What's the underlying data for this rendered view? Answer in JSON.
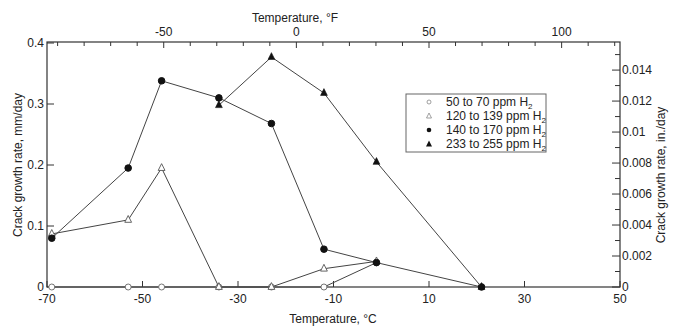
{
  "chart_data": {
    "type": "line",
    "title": "",
    "xlabel": "Temperature, °C",
    "ylabel": "Crack growth rate, mm/day",
    "x2label": "Temperature, °F",
    "y2label": "Crack growth rate, in./day",
    "xlim": [
      -70,
      50
    ],
    "ylim": [
      0,
      0.4
    ],
    "x2lim_F": [
      -94,
      122
    ],
    "y2lim_in": [
      0,
      0.01575
    ],
    "xticks": [
      -70,
      -50,
      -30,
      -10,
      10,
      30,
      50
    ],
    "yticks": [
      0,
      0.1,
      0.2,
      0.3,
      0.4
    ],
    "x2ticks": [
      -50,
      0,
      50,
      100
    ],
    "y2ticks": [
      0,
      0.002,
      0.004,
      0.006,
      0.008,
      0.01,
      0.012,
      0.014
    ],
    "grid": false,
    "legend_position": "upper right (inside)",
    "series": [
      {
        "name": "50 to 70 ppm H2",
        "marker": "open-circle",
        "points": [
          [
            -69,
            0
          ],
          [
            -53,
            0
          ],
          [
            -46,
            0
          ],
          [
            -34,
            0
          ],
          [
            -23,
            0
          ],
          [
            -12,
            0
          ],
          [
            -1,
            0.04
          ]
        ]
      },
      {
        "name": "120 to 139 ppm H2",
        "marker": "open-triangle",
        "points": [
          [
            -69,
            0.087
          ],
          [
            -53,
            0.11
          ],
          [
            -46,
            0.195
          ],
          [
            -34,
            0
          ],
          [
            -23,
            0
          ],
          [
            -12,
            0.03
          ],
          [
            -1,
            0.042
          ]
        ]
      },
      {
        "name": "140 to 170 ppm H2",
        "marker": "filled-circle",
        "points": [
          [
            -69,
            0.08
          ],
          [
            -53,
            0.195
          ],
          [
            -46,
            0.338
          ],
          [
            -34,
            0.31
          ],
          [
            -23,
            0.268
          ],
          [
            -12,
            0.062
          ],
          [
            -1,
            0.04
          ],
          [
            21,
            0
          ]
        ]
      },
      {
        "name": "233 to 255 ppm H2",
        "marker": "filled-triangle",
        "points": [
          [
            -34,
            0.298
          ],
          [
            -23,
            0.377
          ],
          [
            -12,
            0.318
          ],
          [
            -1,
            0.205
          ],
          [
            21,
            0
          ]
        ]
      }
    ]
  },
  "labels": {
    "xlabel": "Temperature, °C",
    "x2label": "Temperature, °F",
    "ylabel": "Crack growth rate, mm/day",
    "y2label": "Crack growth rate, in./day"
  },
  "legend": [
    {
      "label": "50 to 70 ppm H",
      "sub": "2"
    },
    {
      "label": "120 to 139 ppm H",
      "sub": "2"
    },
    {
      "label": "140 to 170 ppm H",
      "sub": "2"
    },
    {
      "label": "233 to 255 ppm H",
      "sub": "2"
    }
  ]
}
